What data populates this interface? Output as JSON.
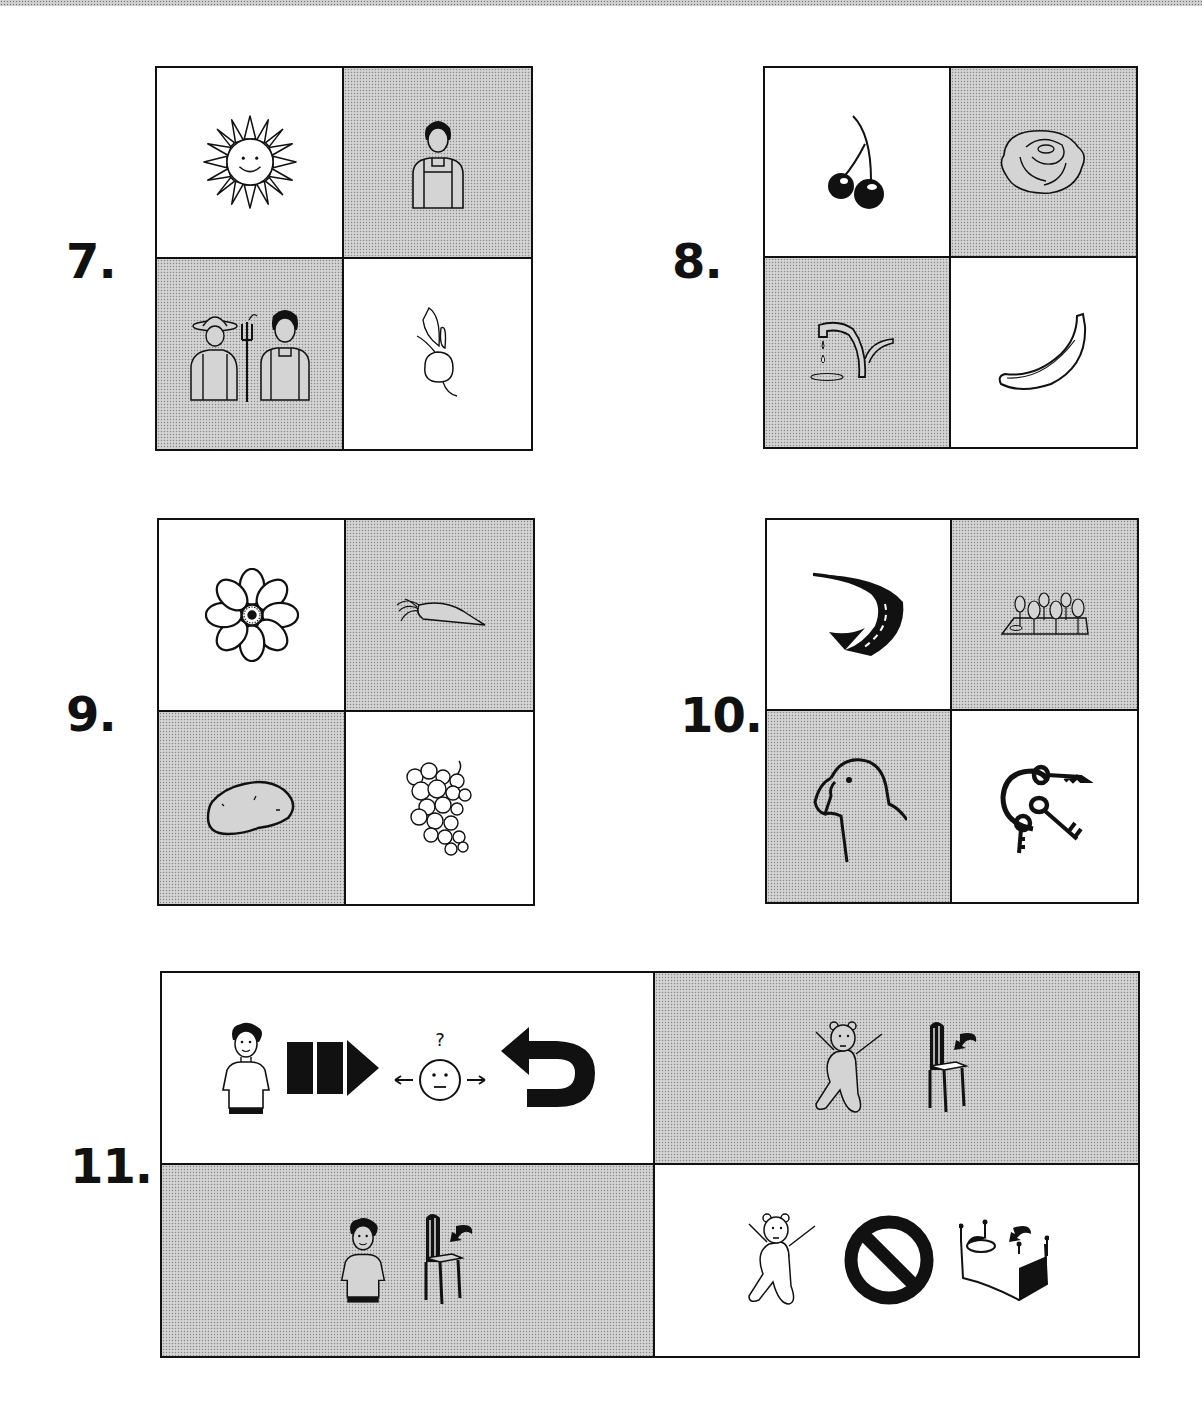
{
  "worksheet": {
    "questions": [
      {
        "number": "7.",
        "cells": [
          {
            "icon": "sun-icon",
            "label": "sun",
            "shade": "white"
          },
          {
            "icon": "woman-icon",
            "label": "woman",
            "shade": "shaded"
          },
          {
            "icon": "farmers-icon",
            "label": "farmers",
            "shade": "shaded"
          },
          {
            "icon": "turnip-icon",
            "label": "turnip",
            "shade": "white"
          }
        ]
      },
      {
        "number": "8.",
        "cells": [
          {
            "icon": "cherries-icon",
            "label": "cherries",
            "shade": "white"
          },
          {
            "icon": "lettuce-icon",
            "label": "lettuce",
            "shade": "shaded"
          },
          {
            "icon": "dripping-tap-icon",
            "label": "tap",
            "shade": "shaded"
          },
          {
            "icon": "banana-icon",
            "label": "banana",
            "shade": "white"
          }
        ]
      },
      {
        "number": "9.",
        "cells": [
          {
            "icon": "flower-icon",
            "label": "flower",
            "shade": "white"
          },
          {
            "icon": "carrot-icon",
            "label": "carrot",
            "shade": "shaded"
          },
          {
            "icon": "potato-icon",
            "label": "potato",
            "shade": "shaded"
          },
          {
            "icon": "grapes-icon",
            "label": "grapes",
            "shade": "white"
          }
        ]
      },
      {
        "number": "10.",
        "cells": [
          {
            "icon": "road-icon",
            "label": "road",
            "shade": "white"
          },
          {
            "icon": "park-icon",
            "label": "park",
            "shade": "shaded"
          },
          {
            "icon": "parrot-icon",
            "label": "parrot",
            "shade": "shaded"
          },
          {
            "icon": "keys-icon",
            "label": "keys",
            "shade": "white"
          }
        ]
      },
      {
        "number": "11.",
        "cells": [
          {
            "icons": [
              "boy-icon",
              "go-forward-icon",
              "unsure-face-icon",
              "turn-back-icon"
            ],
            "label": "boy goes back",
            "shade": "white"
          },
          {
            "icons": [
              "teddy-bear-icon",
              "chair-icon"
            ],
            "label": "teddy on chair",
            "shade": "shaded"
          },
          {
            "icons": [
              "boy-icon",
              "chair-icon"
            ],
            "label": "boy on chair",
            "shade": "shaded"
          },
          {
            "icons": [
              "teddy-bear-icon",
              "no-icon",
              "bed-icon"
            ],
            "label": "teddy not on bed",
            "shade": "white"
          }
        ]
      }
    ]
  },
  "colors": {
    "ink": "#111111",
    "shade": "#d4d4d4",
    "paper": "#ffffff"
  }
}
